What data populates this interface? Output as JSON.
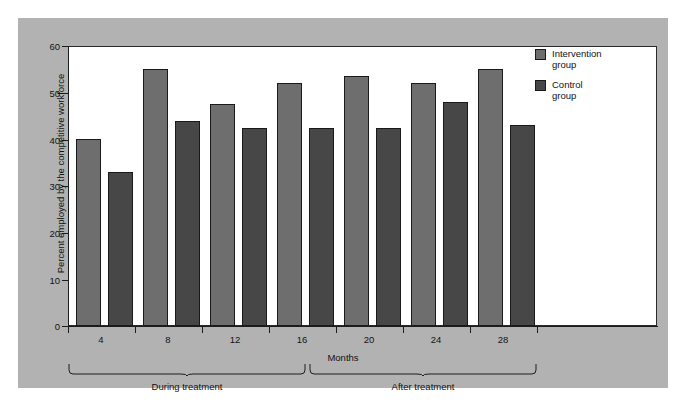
{
  "chart_data": {
    "type": "bar",
    "title": "",
    "xlabel": "Months",
    "ylabel": "Percent employed by the competitive workforce",
    "ylim": [
      0,
      60
    ],
    "ytick_labels": [
      "60",
      "50",
      "40",
      "30",
      "20",
      "10",
      "0"
    ],
    "ytick_values": [
      60,
      50,
      40,
      30,
      20,
      10,
      0
    ],
    "categories": [
      "4",
      "8",
      "12",
      "16",
      "20",
      "24",
      "28"
    ],
    "grid": false,
    "legend_position": "top-right",
    "series": [
      {
        "name": "Intervention group",
        "color": "#6e6e6e",
        "values": [
          40,
          55,
          47.5,
          52,
          53.5,
          52,
          55
        ]
      },
      {
        "name": "Control group",
        "color": "#474747",
        "values": [
          33,
          44,
          42.5,
          42.5,
          42.5,
          48,
          43
        ]
      }
    ],
    "annotations": [
      {
        "label": "During treatment",
        "span_categories": [
          "4",
          "8",
          "12"
        ]
      },
      {
        "label": "After treatment",
        "span_categories": [
          "16",
          "20",
          "24",
          "28"
        ]
      }
    ]
  },
  "legend": {
    "items": [
      {
        "label": "Intervention\ngroup"
      },
      {
        "label": "Control\ngroup"
      }
    ]
  },
  "colors": {
    "panel_background": "#b2b2b2",
    "plot_background": "#ffffff",
    "axis": "#1c1c1c",
    "intervention": "#6e6e6e",
    "control": "#474747"
  }
}
